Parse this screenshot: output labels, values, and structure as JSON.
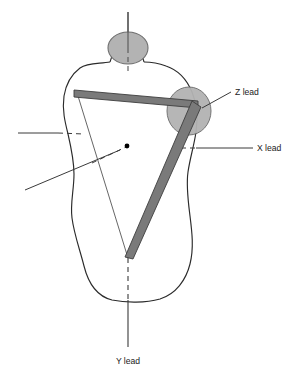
{
  "figure": {
    "background_color": "#ffffff"
  },
  "colors": {
    "outline": "#2b2b2b",
    "electrode_fill": "#b3b3b3",
    "electrode_stroke": "#6e6e6e",
    "thick_lead_fill": "#7a7a7a",
    "thick_lead_stroke": "#3d3d3d",
    "axis_line": "#3a3a3a",
    "thin_triangle": "#4a4a4a",
    "label_text": "#1b1b1b",
    "center_dot": "#000000"
  },
  "labels": {
    "z_lead": "Z lead",
    "x_lead": "X lead",
    "y_lead": "Y lead"
  },
  "anatomy": {
    "head_label": "head",
    "neck_label": "neck",
    "torso_label": "torso",
    "shoulder_electrode_label": "right shoulder electrode"
  },
  "elements": {
    "center_point_label": "heart center point",
    "triangle_label": "lead vector triangle",
    "thick_bar_horizontal_label": "horizontal lead bar",
    "thick_bar_diagonal_label": "diagonal lead bar"
  }
}
